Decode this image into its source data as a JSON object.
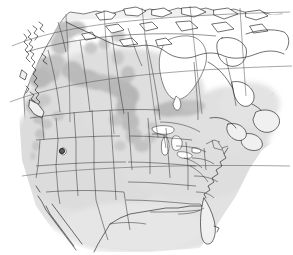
{
  "figure": {
    "name": "north-america-distribution-map",
    "description": "Shaded distribution map of North America showing Canada, United States and northern Mexico with two levels of grey range shading",
    "width": 293,
    "height": 255,
    "background_color": "#ffffff"
  },
  "legend_colors": {
    "background": "#ffffff",
    "land_light_fill": "#f0f0f0",
    "range_light_shade": "#dcdcdc",
    "range_dark_shade": "#b5b5b5",
    "coastline_stroke": "#111111",
    "subdivision_stroke": "#2b2b2b",
    "graticule_stroke": "#3a3a3a",
    "water_fill": "#ffffff",
    "locality_dot_fill": "#5d5d5d"
  },
  "map_features": {
    "landmasses": [
      {
        "id": "continent",
        "name": "north-america-landmass",
        "fill": "#f0f0f0"
      },
      {
        "id": "canada-north",
        "name": "canada-northern-territories",
        "fill": "#ffffff"
      },
      {
        "id": "newfoundland",
        "name": "newfoundland-island",
        "fill": "#f0f0f0"
      },
      {
        "id": "vancouver-island",
        "name": "vancouver-island",
        "fill": "#f0f0f0"
      },
      {
        "id": "baja",
        "name": "baja-california-peninsula",
        "fill": "#f0f0f0"
      }
    ],
    "water_bodies": [
      {
        "id": "hudson-bay",
        "name": "hudson-bay",
        "fill": "#ffffff"
      },
      {
        "id": "great-lakes",
        "name": "great-lakes",
        "fill": "#ffffff"
      },
      {
        "id": "great-salt-lake",
        "name": "great-salt-lake",
        "fill": "#ffffff"
      }
    ],
    "range_shading": [
      {
        "id": "light-envelope",
        "name": "secondary-range-shading",
        "shade": "light",
        "color": "#dcdcdc",
        "coverage": "broad halo across the contiguous United States, southern Canada and the Pacific coast"
      },
      {
        "id": "core-prairie",
        "name": "core-range-prairie-provinces",
        "shade": "dark",
        "color": "#b5b5b5",
        "coverage": "Alberta, Saskatchewan, Manitoba and the northern Great Plains"
      },
      {
        "id": "core-hudson",
        "name": "core-range-hudson-bay-lowland",
        "shade": "dark",
        "color": "#b5b5b5",
        "coverage": "northern Ontario south of Hudson Bay"
      },
      {
        "id": "core-dakotas",
        "name": "core-range-dakotas",
        "shade": "dark",
        "color": "#b5b5b5",
        "coverage": "the Dakotas and western Minnesota"
      },
      {
        "id": "core-great-basin",
        "name": "core-range-great-basin",
        "shade": "dark",
        "color": "#b5b5b5",
        "coverage": "scattered patches in Idaho, Nevada and eastern Oregon"
      },
      {
        "id": "core-bc-interior",
        "name": "core-range-british-columbia-interior",
        "shade": "dark",
        "color": "#b5b5b5",
        "coverage": "interior British Columbia and the Yukon border"
      }
    ],
    "locality_markers": [
      {
        "id": "locality-nevada",
        "name": "locality-marker-great-basin",
        "label": ""
      }
    ],
    "graticule": {
      "name": "graticule-lines",
      "visible": true,
      "style": "sparse curved parallels and meridians"
    },
    "subdivisions": {
      "name": "state-and-province-boundaries",
      "visible": true,
      "count_note": "United States state borders and Canadian provincial borders drawn"
    }
  }
}
